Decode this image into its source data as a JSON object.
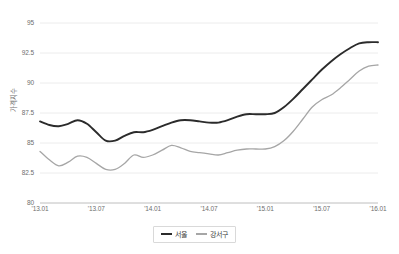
{
  "chart_data": {
    "type": "line",
    "title": "",
    "xlabel": "",
    "ylabel": "가격지수",
    "ylim": [
      80,
      95
    ],
    "grid": true,
    "legend_position": "bottom",
    "y_ticks": [
      "80",
      "82.5",
      "85",
      "87.5",
      "90",
      "92.5",
      "95"
    ],
    "y_tick_values": [
      80,
      82.5,
      85,
      87.5,
      90,
      92.5,
      95
    ],
    "x_ticks": [
      "'13.01",
      "'13.07",
      "'14.01",
      "'14.07",
      "'15.01",
      "'15.07",
      "'16.01"
    ],
    "categories": [
      "'13.01",
      "'13.02",
      "'13.03",
      "'13.04",
      "'13.05",
      "'13.06",
      "'13.07",
      "'13.08",
      "'13.09",
      "'13.10",
      "'13.11",
      "'13.12",
      "'14.01",
      "'14.02",
      "'14.03",
      "'14.04",
      "'14.05",
      "'14.06",
      "'14.07",
      "'14.08",
      "'14.09",
      "'14.10",
      "'14.11",
      "'14.12",
      "'15.01",
      "'15.02",
      "'15.03",
      "'15.04",
      "'15.05",
      "'15.06",
      "'15.07",
      "'15.08",
      "'15.09",
      "'15.10",
      "'15.11",
      "'15.12",
      "'16.01"
    ],
    "series": [
      {
        "name": "서울",
        "color": "#2b2b2b",
        "values": [
          86.8,
          86.5,
          86.4,
          86.6,
          86.9,
          86.6,
          85.9,
          85.2,
          85.2,
          85.6,
          85.9,
          85.9,
          86.1,
          86.4,
          86.7,
          86.9,
          86.9,
          86.8,
          86.7,
          86.7,
          86.9,
          87.2,
          87.4,
          87.4,
          87.4,
          87.5,
          88.0,
          88.7,
          89.5,
          90.3,
          91.1,
          91.8,
          92.4,
          92.9,
          93.3,
          93.4,
          93.4
        ]
      },
      {
        "name": "강서구",
        "color": "#a6a6a6",
        "values": [
          84.3,
          83.6,
          83.1,
          83.4,
          83.9,
          83.8,
          83.3,
          82.8,
          82.8,
          83.3,
          84.0,
          83.8,
          84.0,
          84.4,
          84.8,
          84.6,
          84.3,
          84.2,
          84.1,
          84.0,
          84.2,
          84.4,
          84.5,
          84.5,
          84.5,
          84.7,
          85.2,
          86.0,
          87.0,
          88.0,
          88.6,
          89.0,
          89.6,
          90.3,
          91.0,
          91.4,
          91.5
        ]
      }
    ]
  },
  "legend": {
    "items": [
      {
        "label": "서울",
        "color": "#2b2b2b"
      },
      {
        "label": "강서구",
        "color": "#a6a6a6"
      }
    ]
  }
}
